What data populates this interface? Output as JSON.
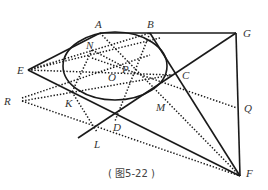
{
  "figure": {
    "caption": "( 图5-22 )",
    "ellipse": {
      "cx": 115,
      "cy": 66,
      "rx": 52,
      "ry": 34
    },
    "points": {
      "A": {
        "label": "A",
        "x": 100,
        "y": 33
      },
      "B": {
        "label": "B",
        "x": 150,
        "y": 33
      },
      "G": {
        "label": "G",
        "x": 236,
        "y": 33
      },
      "E": {
        "label": "E",
        "x": 28,
        "y": 70
      },
      "R": {
        "label": "R",
        "x": 22,
        "y": 101
      },
      "N": {
        "label": "N",
        "x": 92,
        "y": 50
      },
      "P": {
        "label": "P",
        "x": 126,
        "y": 68
      },
      "O": {
        "label": "O",
        "x": 112,
        "y": 74
      },
      "C": {
        "label": "C",
        "x": 172,
        "y": 75
      },
      "K": {
        "label": "K",
        "x": 72,
        "y": 100
      },
      "M": {
        "label": "M",
        "x": 160,
        "y": 108
      },
      "Q": {
        "label": "Q",
        "x": 237,
        "y": 108
      },
      "D": {
        "label": "D",
        "x": 115,
        "y": 121
      },
      "L": {
        "label": "L",
        "x": 97,
        "y": 138
      },
      "F": {
        "label": "F",
        "x": 240,
        "y": 176
      }
    },
    "labels": {
      "A": "A",
      "B": "B",
      "G": "G",
      "E": "E",
      "R": "R",
      "N": "N",
      "P": "P",
      "O": "O",
      "C": "C",
      "K": "K",
      "M": "M",
      "Q": "Q",
      "D": "D",
      "L": "L",
      "F": "F"
    }
  }
}
